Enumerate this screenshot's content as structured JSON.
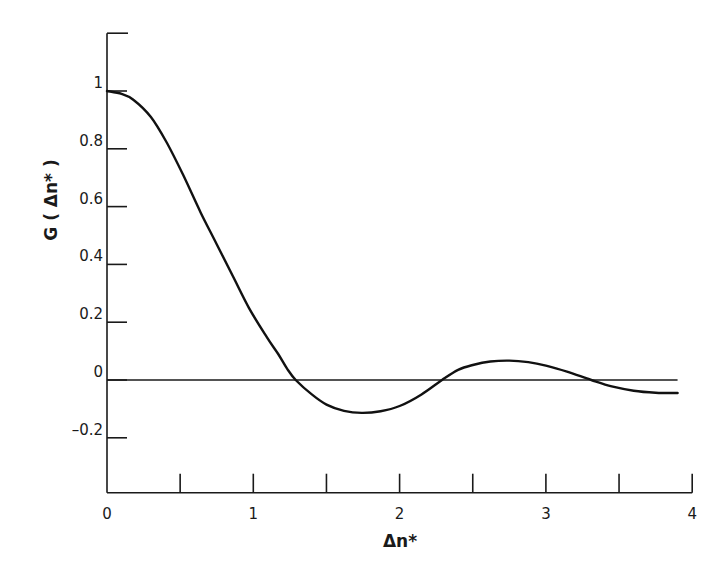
{
  "chart_data": {
    "type": "line",
    "title": "",
    "xlabel": "Δn*",
    "ylabel": "G ( Δn* )",
    "xlim": [
      0,
      4
    ],
    "ylim": [
      -0.39,
      1.2
    ],
    "grid": false,
    "legend": null,
    "x_ticks": [
      0,
      0.5,
      1,
      1.5,
      2,
      2.5,
      3,
      3.5,
      4
    ],
    "x_tick_labels": [
      {
        "value": 0,
        "label": "0"
      },
      {
        "value": 1,
        "label": "1"
      },
      {
        "value": 2,
        "label": "2"
      },
      {
        "value": 3,
        "label": "3"
      },
      {
        "value": 4,
        "label": "4"
      }
    ],
    "y_ticks": [
      {
        "value": 1,
        "label": "1"
      },
      {
        "value": 0.8,
        "label": "0.8"
      },
      {
        "value": 0.6,
        "label": "0.6"
      },
      {
        "value": 0.4,
        "label": "0.4"
      },
      {
        "value": 0.2,
        "label": "0.2"
      },
      {
        "value": 0,
        "label": "0"
      },
      {
        "value": -0.2,
        "label": "-0.2"
      }
    ],
    "reference_lines": [
      {
        "orientation": "horizontal",
        "y": 0,
        "x_from": 0,
        "x_to": 3.9
      }
    ],
    "series": [
      {
        "name": "G(Δn*)",
        "x": [
          0,
          0.1,
          0.18,
          0.3,
          0.41,
          0.52,
          0.64,
          0.75,
          0.86,
          0.97,
          1.09,
          1.17,
          1.23,
          1.29,
          1.4,
          1.5,
          1.62,
          1.74,
          1.87,
          2.0,
          2.15,
          2.29,
          2.4,
          2.5,
          2.62,
          2.75,
          2.88,
          3.0,
          3.15,
          3.31,
          3.45,
          3.6,
          3.75,
          3.9
        ],
        "values": [
          1.0,
          0.99,
          0.97,
          0.91,
          0.82,
          0.71,
          0.58,
          0.47,
          0.36,
          0.25,
          0.15,
          0.09,
          0.04,
          0.0,
          -0.05,
          -0.085,
          -0.107,
          -0.114,
          -0.108,
          -0.09,
          -0.05,
          0.0,
          0.035,
          0.052,
          0.064,
          0.067,
          0.062,
          0.05,
          0.028,
          0.0,
          -0.022,
          -0.037,
          -0.044,
          -0.045
        ]
      }
    ]
  }
}
